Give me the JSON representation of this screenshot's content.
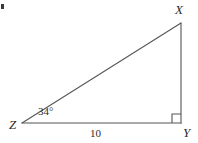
{
  "figure": {
    "type": "right-triangle",
    "background_color": "#ffffff",
    "stroke_color": "#555555",
    "text_color": "#2b2b2b",
    "vertices": [
      {
        "name": "X",
        "label": "X",
        "x": 181,
        "y": 23
      },
      {
        "name": "Y",
        "label": "Y",
        "x": 181,
        "y": 123
      },
      {
        "name": "Z",
        "label": "Z",
        "x": 22,
        "y": 123
      }
    ],
    "edges": [
      {
        "name": "hypotenuse-ZX",
        "from": "Z",
        "to": "X"
      },
      {
        "name": "leg-XY",
        "from": "X",
        "to": "Y"
      },
      {
        "name": "base-ZY",
        "from": "Z",
        "to": "Y"
      }
    ],
    "angles": [
      {
        "name": "angle-at-Z",
        "vertex": "Z",
        "label": "34°",
        "value": 34,
        "unit": "degrees"
      },
      {
        "name": "angle-at-Y",
        "vertex": "Y",
        "label": "",
        "value": 90,
        "unit": "degrees",
        "marker": "right-angle-square"
      }
    ],
    "side_labels": [
      {
        "name": "base-length",
        "edge": "base-ZY",
        "label": "10",
        "value": 10
      }
    ]
  }
}
